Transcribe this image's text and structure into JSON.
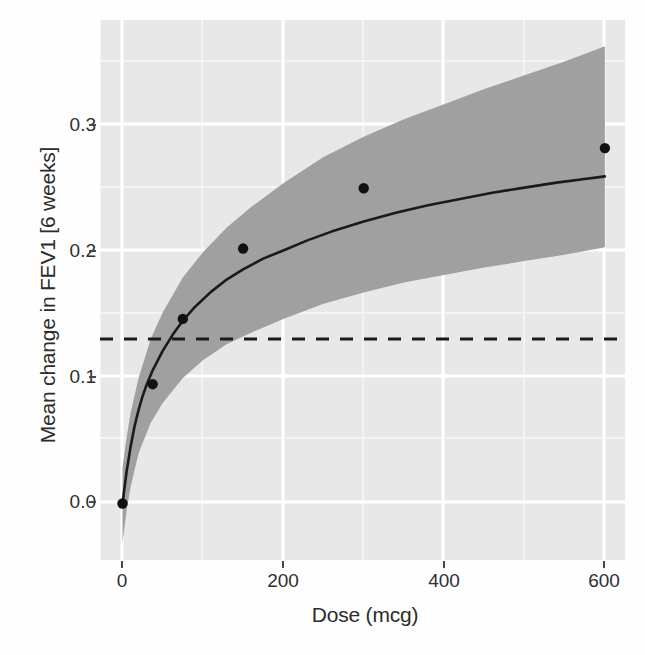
{
  "chart_data": {
    "type": "line",
    "title": "",
    "subtitle": "",
    "xlabel": "Dose (mcg)",
    "ylabel": "Mean change in FEV1 [6 weeks]",
    "xlim": [
      -28,
      625
    ],
    "ylim": [
      -0.045,
      0.385
    ],
    "xticks": [
      0,
      200,
      400,
      600
    ],
    "xtick_labels": [
      "0",
      "200",
      "400",
      "600"
    ],
    "yticks": [
      0.0,
      0.1,
      0.2,
      0.3
    ],
    "ytick_labels": [
      "0.0",
      "0.1",
      "0.2",
      "0.3"
    ],
    "grid": true,
    "grid_color": "#ffffff",
    "panel_background": "#e8e8e8",
    "legend": null,
    "legend_position": "none",
    "series": [
      {
        "name": "Predicted mean dose-response (Emax)",
        "type": "line",
        "color": "#1a1a1a",
        "x": [
          0,
          5,
          10,
          15,
          20,
          25,
          30,
          37.5,
          50,
          62.5,
          75,
          90,
          110,
          130,
          150,
          175,
          200,
          230,
          260,
          300,
          340,
          380,
          420,
          460,
          500,
          540,
          570,
          600
        ],
        "y": [
          0.0,
          0.025,
          0.045,
          0.0615,
          0.0745,
          0.0855,
          0.0945,
          0.106,
          0.1215,
          0.1345,
          0.1455,
          0.1565,
          0.1685,
          0.1785,
          0.1865,
          0.195,
          0.2015,
          0.2095,
          0.2165,
          0.2245,
          0.2315,
          0.2375,
          0.2425,
          0.2475,
          0.2515,
          0.2555,
          0.258,
          0.2605
        ]
      },
      {
        "name": "Observed dose groups",
        "type": "scatter",
        "color": "#111111",
        "x": [
          0,
          37.5,
          75,
          150,
          300,
          600
        ],
        "y": [
          0.0,
          0.095,
          0.147,
          0.203,
          0.251,
          0.283
        ]
      }
    ],
    "confidence_band": {
      "name": "95% confidence interval",
      "color": "#a0a0a0",
      "opacity": 1,
      "x": [
        0,
        5,
        10,
        20,
        35,
        50,
        75,
        100,
        130,
        160,
        200,
        250,
        300,
        350,
        400,
        450,
        500,
        550,
        600
      ],
      "lower": [
        -0.031,
        -0.006,
        0.013,
        0.04,
        0.064,
        0.08,
        0.1,
        0.114,
        0.127,
        0.136,
        0.147,
        0.159,
        0.168,
        0.176,
        0.182,
        0.188,
        0.193,
        0.198,
        0.204
      ],
      "upper": [
        0.028,
        0.052,
        0.072,
        0.1,
        0.131,
        0.152,
        0.18,
        0.2,
        0.22,
        0.236,
        0.255,
        0.276,
        0.292,
        0.306,
        0.318,
        0.33,
        0.341,
        0.352,
        0.364
      ]
    },
    "reference_line": {
      "name": "clinical relevance threshold",
      "orientation": "horizontal",
      "value": 0.131,
      "style": "dashed",
      "color": "#1a1a1a"
    },
    "annotations": []
  },
  "axes": {
    "y_title": "Mean change in FEV1 [6 weeks]",
    "x_title": "Dose (mcg)",
    "y_labels": [
      "0.3",
      "0.2",
      "0.1",
      "0.0"
    ],
    "x_labels": [
      "0",
      "200",
      "400",
      "600"
    ]
  }
}
